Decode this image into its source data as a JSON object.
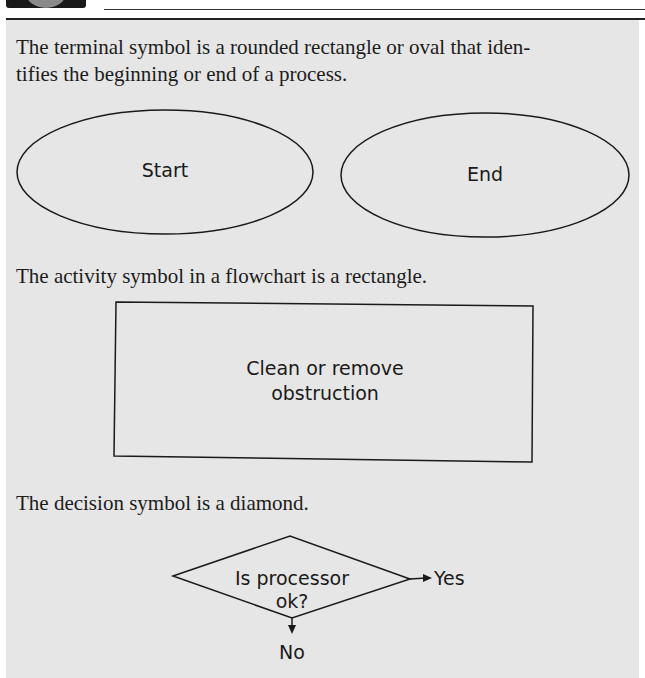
{
  "paragraphs": {
    "terminal": "The terminal symbol is a rounded rectangle or oval that identifies the beginning or end of a process.",
    "terminal_line1": "The terminal symbol is a rounded rectangle or oval that iden-",
    "terminal_line2": "tifies the beginning or end of a process.",
    "activity": "The activity symbol in a flowchart is a rectangle.",
    "decision": "The decision symbol is a diamond."
  },
  "terminal_symbols": [
    {
      "label": "Start",
      "shape": "oval"
    },
    {
      "label": "End",
      "shape": "oval"
    }
  ],
  "activity_symbol": {
    "line1": "Clean or remove",
    "line2": "obstruction",
    "shape": "rectangle"
  },
  "decision_symbol": {
    "line1": "Is processor",
    "line2": "ok?",
    "shape": "diamond",
    "yes_label": "Yes",
    "no_label": "No"
  },
  "colors": {
    "panel_background": "#e6e6e6",
    "stroke": "#1a1a1a",
    "text": "#1c1c1c"
  }
}
